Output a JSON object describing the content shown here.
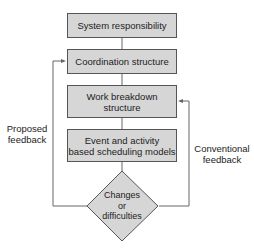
{
  "diagram": {
    "nodes": [
      {
        "id": "n1",
        "label": "System responsibility",
        "shape": "box"
      },
      {
        "id": "n2",
        "label": "Coordination structure",
        "shape": "box"
      },
      {
        "id": "n3",
        "label": "Work breakdown structure",
        "line1": "Work breakdown",
        "line2": "structure",
        "shape": "box"
      },
      {
        "id": "n4",
        "label": "Event and activity based scheduling models",
        "line1": "Event and activity",
        "line2": "based scheduling models",
        "shape": "box"
      },
      {
        "id": "n5",
        "label": "Changes or difficulties",
        "line1": "Changes",
        "line2": "or",
        "line3": "difficulties",
        "shape": "diamond"
      }
    ],
    "edges": [
      {
        "from": "n1",
        "to": "n2"
      },
      {
        "from": "n2",
        "to": "n3"
      },
      {
        "from": "n3",
        "to": "n4"
      },
      {
        "from": "n4",
        "to": "n5"
      },
      {
        "from": "n5",
        "to": "n2",
        "label": "Proposed feedback",
        "side": "left"
      },
      {
        "from": "n5",
        "to": "n3",
        "label": "Conventional feedback",
        "side": "right"
      }
    ],
    "feedback_left": {
      "line1": "Proposed",
      "line2": "feedback"
    },
    "feedback_right": {
      "line1": "Conventional",
      "line2": "feedback"
    },
    "colors": {
      "box_fill": "#d6d6d6",
      "stroke": "#555555",
      "text": "#222222"
    }
  }
}
